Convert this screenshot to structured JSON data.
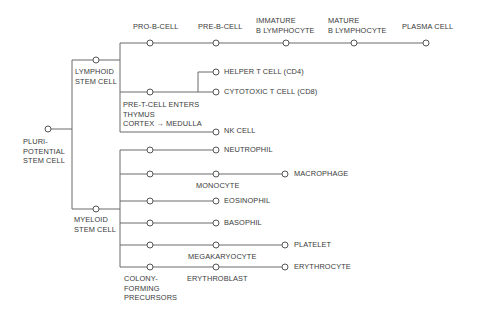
{
  "diagram": {
    "nodes": {
      "pluripotent": "PLURI-\nPOTENTIAL\nSTEM CELL",
      "lymphoid": "LYMPHOID\nSTEM CELL",
      "myeloid": "MYELOID\nSTEM CELL",
      "pro_b": "PRO-B-CELL",
      "pre_b": "PRE-B-CELL",
      "immature_b": "IMMATURE\nB LYMPHOCYTE",
      "mature_b": "MATURE\nB LYMPHOCYTE",
      "plasma": "PLASMA CELL",
      "pre_t": "PRE-T-CELL ENTERS\nTHYMUS\nCORTEX → MEDULLA",
      "helper_t": "HELPER T CELL (CD4)",
      "cytotoxic_t": "CYTOTOXIC T CELL (CD8)",
      "nk": "NK CELL",
      "neutrophil": "NEUTROPHIL",
      "monocyte": "MONOCYTE",
      "macrophage": "MACROPHAGE",
      "eosinophil": "EOSINOPHIL",
      "basophil": "BASOPHIL",
      "megakaryocyte": "MEGAKARYOCYTE",
      "platelet": "PLATELET",
      "erythroblast": "ERYTHROBLAST",
      "erythrocyte": "ERYTHROCYTE",
      "colony": "COLONY-\nFORMING\nPRECURSORS"
    },
    "colors": {
      "line": "#6a6a6a",
      "node_stroke": "#555555",
      "text": "#3a3a3a",
      "background": "#ffffff"
    }
  }
}
